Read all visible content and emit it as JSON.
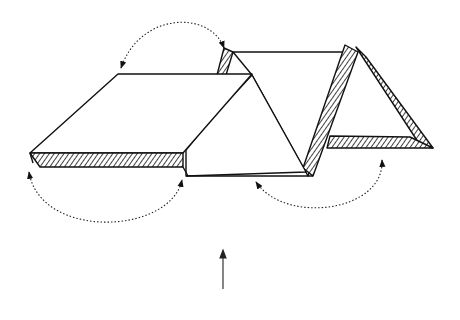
{
  "diagram": {
    "colors": {
      "line": "#111111",
      "background": "#ffffff",
      "hatch": "#111111"
    },
    "fold_arrows": [
      {
        "id": "top-arc",
        "from": "top-left corner of flat panel",
        "to": "back hatched flap"
      },
      {
        "id": "left-arc",
        "from": "left hatched flap",
        "to": "bottom edge under flat panel"
      },
      {
        "id": "right-arc",
        "from": "base of middle triangle",
        "to": "bottom hatched strip of right triangle"
      }
    ],
    "view_arrow": {
      "direction": "up"
    }
  }
}
